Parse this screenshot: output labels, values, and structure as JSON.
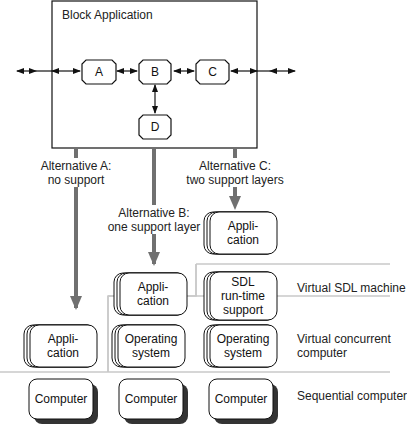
{
  "diagram": {
    "block": {
      "title": "Block Application",
      "nodes": [
        {
          "id": "A",
          "label": "A"
        },
        {
          "id": "B",
          "label": "B"
        },
        {
          "id": "C",
          "label": "C"
        },
        {
          "id": "D",
          "label": "D"
        }
      ]
    },
    "alternatives": [
      {
        "id": "A",
        "line1": "Alternative A:",
        "line2": "no support"
      },
      {
        "id": "B",
        "line1": "Alternative B:",
        "line2": "one support layer"
      },
      {
        "id": "C",
        "line1": "Alternative C:",
        "line2": "two support layers"
      }
    ],
    "stacks": {
      "a_app": "Appli-\ncation",
      "b_app": "Appli-\ncation",
      "b_os": "Operating\nsystem",
      "c_app": "Appli-\ncation",
      "c_sdl": "SDL\nrun-time\nsupport",
      "c_os": "Operating\nsystem",
      "computer": "Computer"
    },
    "layers": [
      {
        "label": "Virtual SDL machine"
      },
      {
        "label": "Virtual concurrent\ncomputer"
      },
      {
        "label": "Sequential computer"
      }
    ],
    "colors": {
      "line": "#111111",
      "thick_arrow": "#707070",
      "separator": "#c8c8c8",
      "shadow": "#333333"
    }
  }
}
